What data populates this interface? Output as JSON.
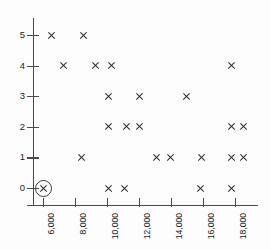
{
  "chart_data": {
    "type": "scatter",
    "title": "",
    "subtitle": "",
    "xlabel": "",
    "ylabel": "",
    "xlim": [
      5000,
      19000
    ],
    "ylim": [
      0,
      5
    ],
    "grid": false,
    "legend": null,
    "x_ticks": [
      6000,
      8000,
      10000,
      12000,
      14000,
      16000,
      18000
    ],
    "x_tick_labels": [
      "6,000",
      "8,000",
      "10,000",
      "12,000",
      "14,000",
      "16,000",
      "18,000"
    ],
    "x_tick_label_rotation": -90,
    "y_ticks": [
      0,
      1,
      2,
      3,
      4,
      5
    ],
    "y_tick_labels": [
      "0",
      "1",
      "2",
      "3",
      "4",
      "5"
    ],
    "marker": "x",
    "marker_color": "#2b2b2b",
    "points": [
      {
        "x": 6500,
        "y": 5,
        "highlighted": false
      },
      {
        "x": 8500,
        "y": 5,
        "highlighted": false
      },
      {
        "x": 7300,
        "y": 4,
        "highlighted": false
      },
      {
        "x": 9300,
        "y": 4,
        "highlighted": false
      },
      {
        "x": 10250,
        "y": 4,
        "highlighted": false
      },
      {
        "x": 17750,
        "y": 4,
        "highlighted": false
      },
      {
        "x": 10100,
        "y": 3,
        "highlighted": false
      },
      {
        "x": 12050,
        "y": 3,
        "highlighted": false
      },
      {
        "x": 14950,
        "y": 3,
        "highlighted": false
      },
      {
        "x": 10100,
        "y": 2,
        "highlighted": false
      },
      {
        "x": 11200,
        "y": 2,
        "highlighted": false
      },
      {
        "x": 12000,
        "y": 2,
        "highlighted": false
      },
      {
        "x": 17750,
        "y": 2,
        "highlighted": false
      },
      {
        "x": 18500,
        "y": 2,
        "highlighted": false
      },
      {
        "x": 8400,
        "y": 1,
        "highlighted": false
      },
      {
        "x": 13100,
        "y": 1,
        "highlighted": false
      },
      {
        "x": 13950,
        "y": 1,
        "highlighted": false
      },
      {
        "x": 15900,
        "y": 1,
        "highlighted": false
      },
      {
        "x": 17750,
        "y": 1,
        "highlighted": false
      },
      {
        "x": 18500,
        "y": 1,
        "highlighted": false
      },
      {
        "x": 6000,
        "y": 0,
        "highlighted": true
      },
      {
        "x": 10100,
        "y": 0,
        "highlighted": false
      },
      {
        "x": 11100,
        "y": 0,
        "highlighted": false
      },
      {
        "x": 15850,
        "y": 0,
        "highlighted": false
      },
      {
        "x": 17750,
        "y": 0,
        "highlighted": false
      }
    ],
    "highlight_annotation": {
      "shape": "circle",
      "point": {
        "x": 6000,
        "y": 0
      },
      "color": "#3a3a3a"
    }
  },
  "axis_color": "#4a4a4a",
  "background": "#fdfdfd"
}
